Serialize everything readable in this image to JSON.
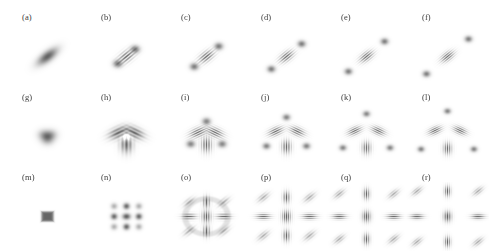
{
  "figure": {
    "title_fragment": "",
    "background_color": "#ffffff",
    "ink_color": "#5a5a5a",
    "rows": 3,
    "columns": 6,
    "panel_count": 18
  },
  "chart_data": {
    "type": "heatmap",
    "title": "",
    "subtitle": "",
    "xlabel": "",
    "ylabel": "",
    "grid": false,
    "legend": "none",
    "colormap": "grayscale-inverted",
    "axis_ranges": {
      "x": [
        -1,
        1
      ],
      "y": [
        -1,
        1
      ]
    },
    "panels": [
      {
        "id": "a",
        "label": "(a)",
        "row": 1,
        "col": 1,
        "symmetry": 2,
        "fringes": 0,
        "satellites": 0,
        "peak_radius": 0.0,
        "blob_sigma": 0.085,
        "blobs": [
          {
            "x": 0.0,
            "y": 0.0,
            "amp": 1.0
          }
        ],
        "fringe_angle_deg": 45,
        "fringe_period": 0.0,
        "notes": "single elongated lobe tilted 45 degrees"
      },
      {
        "id": "b",
        "label": "(b)",
        "row": 1,
        "col": 2,
        "symmetry": 2,
        "fringes": 3,
        "satellites": 2,
        "peak_radius": 0.3,
        "blob_sigma": 0.085,
        "blobs": [
          {
            "x": 0.0,
            "y": 0.0,
            "amp": 1.0
          }
        ],
        "fringe_angle_deg": 45,
        "fringe_period": 0.075,
        "notes": "central fringed lobe with two close satellite peaks on the diagonal"
      },
      {
        "id": "c",
        "label": "(c)",
        "row": 1,
        "col": 3,
        "symmetry": 2,
        "fringes": 4,
        "satellites": 2,
        "peak_radius": 0.42,
        "blob_sigma": 0.08,
        "blobs": [
          {
            "x": 0.0,
            "y": 0.0,
            "amp": 1.0
          }
        ],
        "fringe_angle_deg": 45,
        "fringe_period": 0.068,
        "notes": "fringed lobe with two separated satellite peaks"
      },
      {
        "id": "d",
        "label": "(d)",
        "row": 1,
        "col": 4,
        "symmetry": 2,
        "fringes": 4,
        "satellites": 2,
        "peak_radius": 0.52,
        "blob_sigma": 0.075,
        "blobs": [
          {
            "x": 0.0,
            "y": 0.0,
            "amp": 1.0
          }
        ],
        "fringe_angle_deg": 45,
        "fringe_period": 0.062,
        "notes": "wider satellite separation"
      },
      {
        "id": "e",
        "label": "(e)",
        "row": 1,
        "col": 5,
        "symmetry": 2,
        "fringes": 5,
        "satellites": 2,
        "peak_radius": 0.62,
        "blob_sigma": 0.072,
        "blobs": [
          {
            "x": 0.0,
            "y": 0.0,
            "amp": 1.0
          }
        ],
        "fringe_angle_deg": 45,
        "fringe_period": 0.058,
        "notes": "satellites near panel edges"
      },
      {
        "id": "f",
        "label": "(f)",
        "row": 1,
        "col": 6,
        "symmetry": 2,
        "fringes": 5,
        "satellites": 2,
        "peak_radius": 0.72,
        "blob_sigma": 0.07,
        "blobs": [
          {
            "x": 0.0,
            "y": 0.0,
            "amp": 1.0
          }
        ],
        "fringe_angle_deg": 45,
        "fringe_period": 0.055,
        "notes": "maximum satellite separation in row 1"
      },
      {
        "id": "g",
        "label": "(g)",
        "row": 2,
        "col": 1,
        "symmetry": 3,
        "fringes": 0,
        "satellites": 0,
        "peak_radius": 0.1,
        "blob_sigma": 0.085,
        "lobe_radius": 0.1,
        "fringe_period": 0.0,
        "notes": "small solid triangular trefoil"
      },
      {
        "id": "h",
        "label": "(h)",
        "row": 2,
        "col": 2,
        "symmetry": 3,
        "fringes": 1,
        "satellites": 0,
        "peak_radius": 0.22,
        "blob_sigma": 0.105,
        "lobe_radius": 0.22,
        "fringe_period": 0.1,
        "notes": "three dark lobes around a bright center"
      },
      {
        "id": "i",
        "label": "(i)",
        "row": 2,
        "col": 3,
        "symmetry": 3,
        "fringes": 4,
        "satellites": 3,
        "peak_radius": 0.44,
        "blob_sigma": 0.09,
        "lobe_radius": 0.24,
        "fringe_period": 0.062,
        "notes": "three fringed lobes plus three corner satellite peaks, overlapping"
      },
      {
        "id": "j",
        "label": "(j)",
        "row": 2,
        "col": 4,
        "symmetry": 3,
        "fringes": 4,
        "satellites": 3,
        "peak_radius": 0.56,
        "blob_sigma": 0.08,
        "lobe_radius": 0.3,
        "fringe_period": 0.06,
        "notes": "lobes and satellites beginning to separate"
      },
      {
        "id": "k",
        "label": "(k)",
        "row": 2,
        "col": 5,
        "symmetry": 3,
        "fringes": 5,
        "satellites": 3,
        "peak_radius": 0.66,
        "blob_sigma": 0.075,
        "lobe_radius": 0.33,
        "fringe_period": 0.056,
        "notes": "clearly separated fringed lobes and satellites"
      },
      {
        "id": "l",
        "label": "(l)",
        "row": 2,
        "col": 6,
        "symmetry": 3,
        "fringes": 5,
        "satellites": 3,
        "peak_radius": 0.74,
        "blob_sigma": 0.072,
        "lobe_radius": 0.35,
        "fringe_period": 0.054,
        "notes": "maximum separation in row 2"
      },
      {
        "id": "m",
        "label": "(m)",
        "row": 3,
        "col": 1,
        "symmetry": 4,
        "fringes": 0,
        "satellites": 0,
        "peak_radius": 0.0,
        "blob_sigma": 0.075,
        "lattice": 1,
        "fringe_period": 0.0,
        "notes": "single small square blob"
      },
      {
        "id": "n",
        "label": "(n)",
        "row": 3,
        "col": 2,
        "symmetry": 4,
        "fringes": 0,
        "satellites": 8,
        "peak_radius": 0.3,
        "blob_sigma": 0.05,
        "lattice": 3,
        "fringe_period": 0.0,
        "notes": "ring of eight dots around a central dot"
      },
      {
        "id": "o",
        "label": "(o)",
        "row": 3,
        "col": 3,
        "symmetry": 4,
        "fringes": 2,
        "satellites": 8,
        "peak_radius": 0.42,
        "blob_sigma": 0.055,
        "lattice": 3,
        "fringe_period": 0.072,
        "notes": "fringed 3x3 lattice inside a soft square envelope"
      },
      {
        "id": "p",
        "label": "(p)",
        "row": 3,
        "col": 4,
        "symmetry": 4,
        "fringes": 3,
        "satellites": 8,
        "peak_radius": 0.56,
        "blob_sigma": 0.055,
        "lattice": 3,
        "fringe_period": 0.06,
        "notes": "separated 3x3 lattice, edge cells strongly fringed"
      },
      {
        "id": "q",
        "label": "(q)",
        "row": 3,
        "col": 5,
        "symmetry": 4,
        "fringes": 4,
        "satellites": 8,
        "peak_radius": 0.66,
        "blob_sigma": 0.052,
        "lattice": 3,
        "fringe_period": 0.055,
        "notes": "wider 3x3 lattice with faint corner cells"
      },
      {
        "id": "r",
        "label": "(r)",
        "row": 3,
        "col": 6,
        "symmetry": 4,
        "fringes": 4,
        "satellites": 8,
        "peak_radius": 0.74,
        "blob_sigma": 0.05,
        "lattice": 3,
        "fringe_period": 0.052,
        "notes": "widest 3x3 lattice, densest fringes"
      }
    ]
  },
  "layout": {
    "panel_width": 83,
    "panel_height": 81,
    "column_x": [
      6,
      85,
      165,
      245,
      325,
      406
    ],
    "row_y": [
      10,
      90,
      170
    ]
  }
}
